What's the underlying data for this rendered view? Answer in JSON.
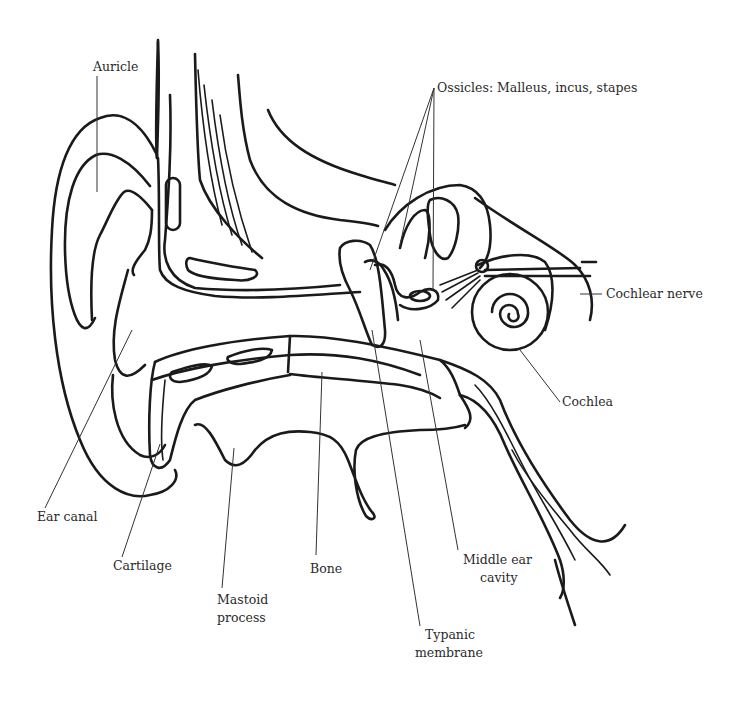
{
  "diagram": {
    "colors": {
      "line": "#1a1a1a",
      "text": "#2a2a2a",
      "background": "#ffffff"
    },
    "labels": [
      {
        "id": "auricle",
        "text": "Auricle"
      },
      {
        "id": "ossicles",
        "text": "Ossicles: Malleus, incus, stapes"
      },
      {
        "id": "cochlear_nerve",
        "text": "Cochlear nerve"
      },
      {
        "id": "cochlea",
        "text": "Cochlea"
      },
      {
        "id": "ear_canal",
        "text": "Ear canal"
      },
      {
        "id": "cartilage",
        "text": "Cartilage"
      },
      {
        "id": "bone",
        "text": "Bone"
      },
      {
        "id": "mastoid_1",
        "text": "Mastoid"
      },
      {
        "id": "mastoid_2",
        "text": "process"
      },
      {
        "id": "middle_ear_1",
        "text": "Middle ear"
      },
      {
        "id": "middle_ear_2",
        "text": "cavity"
      },
      {
        "id": "typanic_1",
        "text": "Typanic"
      },
      {
        "id": "typanic_2",
        "text": "membrane"
      }
    ]
  }
}
